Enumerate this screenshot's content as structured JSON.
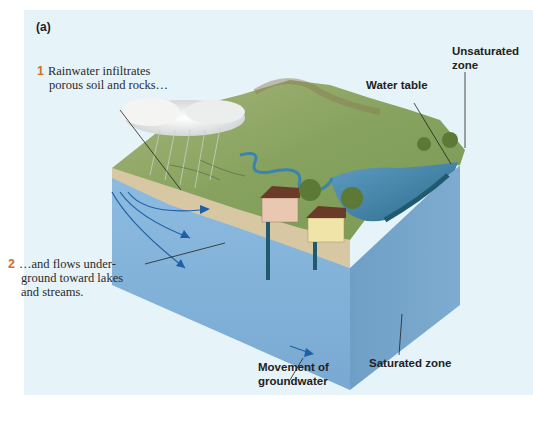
{
  "figure": {
    "panel_label": "(a)",
    "callouts": [
      {
        "number": "1",
        "text_line1": "Rainwater infiltrates",
        "text_line2": "porous soil and rocks…"
      },
      {
        "number": "2",
        "text_line1": "…and flows under-",
        "text_line2": "ground toward lakes",
        "text_line3": "and streams."
      }
    ],
    "labels": {
      "unsaturated_zone_line1": "Unsaturated",
      "unsaturated_zone_line2": "zone",
      "water_table": "Water table",
      "movement_line1": "Movement of",
      "movement_line2": "groundwater",
      "saturated_zone": "Saturated zone"
    },
    "colors": {
      "background_panel": "#e6f3f8",
      "callout_number": "#d0702a",
      "groundwater_front": "#7fb0d6",
      "groundwater_side": "#6a9cc4",
      "arrow": "#1f5fa8",
      "land": "#8fa86a",
      "lake": "#3f7fa6"
    }
  }
}
